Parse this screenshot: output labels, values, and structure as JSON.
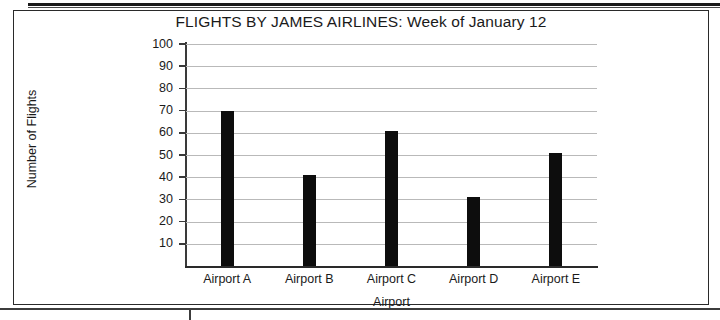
{
  "chart_data": {
    "type": "bar",
    "title": "FLIGHTS BY JAMES AIRLINES: Week of January 12",
    "xlabel": "Airport",
    "ylabel": "Number of Flights",
    "categories": [
      "Airport A",
      "Airport B",
      "Airport C",
      "Airport D",
      "Airport E"
    ],
    "values": [
      70,
      41,
      61,
      31,
      51
    ],
    "ylim": [
      0,
      100
    ],
    "ytick_labels": [
      "100",
      "90",
      "80",
      "70",
      "60",
      "50",
      "40",
      "30",
      "20",
      "10"
    ],
    "ytick_values": [
      100,
      90,
      80,
      70,
      60,
      50,
      40,
      30,
      20,
      10
    ],
    "grid": true,
    "legend": "none",
    "bar_color": "#0d0d0d",
    "grid_color": "#b9b9b9",
    "axis_color": "#2a2a2a"
  }
}
